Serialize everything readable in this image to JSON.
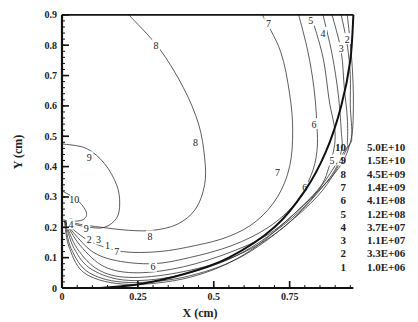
{
  "chart_data": {
    "type": "contour",
    "title": "",
    "xlabel": "X (cm)",
    "ylabel": "Y (cm)",
    "xlim": [
      0,
      0.96
    ],
    "ylim": [
      0,
      0.9
    ],
    "x_ticks": [
      {
        "value": 0,
        "label": "0"
      },
      {
        "value": 0.25,
        "label": "0.25"
      },
      {
        "value": 0.5,
        "label": "0.5"
      },
      {
        "value": 0.75,
        "label": "0.75"
      }
    ],
    "y_ticks": [
      {
        "value": 0,
        "label": "0"
      },
      {
        "value": 0.1,
        "label": "0.1"
      },
      {
        "value": 0.2,
        "label": "0.2"
      },
      {
        "value": 0.3,
        "label": "0.3"
      },
      {
        "value": 0.4,
        "label": "0.4"
      },
      {
        "value": 0.5,
        "label": "0.5"
      },
      {
        "value": 0.6,
        "label": "0.6"
      },
      {
        "value": 0.7,
        "label": "0.7"
      },
      {
        "value": 0.8,
        "label": "0.8"
      },
      {
        "value": 0.9,
        "label": "0.9"
      }
    ],
    "grid": false,
    "legend_position": "right",
    "legend": [
      {
        "level": "10",
        "value": "5.0E+10"
      },
      {
        "level": "9",
        "value": "1.5E+10"
      },
      {
        "level": "8",
        "value": "4.5E+09"
      },
      {
        "level": "7",
        "value": "1.4E+09"
      },
      {
        "level": "6",
        "value": "4.1E+08"
      },
      {
        "level": "5",
        "value": "1.2E+08"
      },
      {
        "level": "4",
        "value": "3.7E+07"
      },
      {
        "level": "3",
        "value": "1.1E+07"
      },
      {
        "level": "2",
        "value": "3.3E+06"
      },
      {
        "level": "1",
        "value": "1.0E+06"
      }
    ],
    "boundary": {
      "description": "quarter-circle domain edge from (0.96,0.9) curving down to (0.1,0)",
      "points": [
        [
          0.96,
          0.9
        ],
        [
          0.95,
          0.75
        ],
        [
          0.92,
          0.6
        ],
        [
          0.87,
          0.45
        ],
        [
          0.8,
          0.32
        ],
        [
          0.7,
          0.2
        ],
        [
          0.55,
          0.1
        ],
        [
          0.4,
          0.045
        ],
        [
          0.25,
          0.012
        ],
        [
          0.12,
          0.0
        ]
      ]
    },
    "contours": [
      {
        "level": "8",
        "points": [
          [
            0.22,
            0.9
          ],
          [
            0.32,
            0.79
          ],
          [
            0.4,
            0.66
          ],
          [
            0.45,
            0.54
          ],
          [
            0.47,
            0.43
          ],
          [
            0.47,
            0.34
          ],
          [
            0.44,
            0.26
          ],
          [
            0.38,
            0.21
          ],
          [
            0.3,
            0.19
          ],
          [
            0.22,
            0.19
          ],
          [
            0.13,
            0.2
          ],
          [
            0.06,
            0.21
          ],
          [
            0.02,
            0.22
          ]
        ],
        "labels": [
          {
            "x": 0.31,
            "y": 0.8
          },
          [
            0.44,
            0.48
          ],
          [
            0.29,
            0.17
          ]
        ]
      },
      {
        "level": "9",
        "points": [
          [
            0.0,
            0.475
          ],
          [
            0.08,
            0.46
          ],
          [
            0.14,
            0.41
          ],
          [
            0.18,
            0.34
          ],
          [
            0.19,
            0.28
          ],
          [
            0.18,
            0.23
          ],
          [
            0.14,
            0.2
          ],
          [
            0.09,
            0.2
          ],
          [
            0.04,
            0.21
          ],
          [
            0.01,
            0.22
          ]
        ],
        "labels": [
          [
            0.09,
            0.43
          ],
          [
            0.08,
            0.195
          ]
        ]
      },
      {
        "level": "10",
        "points": [
          [
            0.0,
            0.32
          ],
          [
            0.05,
            0.29
          ],
          [
            0.08,
            0.25
          ],
          [
            0.07,
            0.225
          ],
          [
            0.03,
            0.22
          ],
          [
            0.005,
            0.225
          ]
        ],
        "labels": [
          [
            0.04,
            0.29
          ]
        ]
      },
      {
        "level": "7",
        "points": [
          [
            0.66,
            0.9
          ],
          [
            0.72,
            0.78
          ],
          [
            0.75,
            0.64
          ],
          [
            0.76,
            0.52
          ],
          [
            0.75,
            0.4
          ],
          [
            0.71,
            0.3
          ],
          [
            0.64,
            0.22
          ],
          [
            0.55,
            0.17
          ],
          [
            0.44,
            0.14
          ],
          [
            0.32,
            0.12
          ],
          [
            0.2,
            0.12
          ],
          [
            0.1,
            0.15
          ],
          [
            0.04,
            0.19
          ],
          [
            0.01,
            0.22
          ]
        ],
        "labels": [
          [
            0.68,
            0.87
          ],
          [
            0.71,
            0.38
          ],
          [
            0.18,
            0.12
          ]
        ]
      },
      {
        "level": "6",
        "points": [
          [
            0.78,
            0.9
          ],
          [
            0.81,
            0.78
          ],
          [
            0.83,
            0.66
          ],
          [
            0.84,
            0.54
          ],
          [
            0.84,
            0.45
          ],
          [
            0.82,
            0.37
          ],
          [
            0.77,
            0.28
          ],
          [
            0.68,
            0.2
          ],
          [
            0.56,
            0.14
          ],
          [
            0.42,
            0.1
          ],
          [
            0.3,
            0.08
          ],
          [
            0.18,
            0.09
          ],
          [
            0.1,
            0.12
          ],
          [
            0.04,
            0.18
          ],
          [
            0.01,
            0.22
          ]
        ],
        "labels": [
          [
            0.83,
            0.54
          ],
          [
            0.8,
            0.33
          ],
          [
            0.3,
            0.07
          ]
        ]
      },
      {
        "level": "5",
        "points": [
          [
            0.82,
            0.9
          ],
          [
            0.86,
            0.76
          ],
          [
            0.88,
            0.62
          ],
          [
            0.9,
            0.5
          ],
          [
            0.88,
            0.4
          ],
          [
            0.84,
            0.32
          ],
          [
            0.7,
            0.19
          ],
          [
            0.56,
            0.12
          ],
          [
            0.4,
            0.07
          ],
          [
            0.25,
            0.05
          ],
          [
            0.14,
            0.07
          ],
          [
            0.06,
            0.14
          ],
          [
            0.01,
            0.22
          ]
        ],
        "labels": [
          [
            0.82,
            0.88
          ],
          [
            0.89,
            0.42
          ],
          [
            0.03,
            0.22
          ]
        ]
      },
      {
        "level": "4",
        "points": [
          [
            0.86,
            0.9
          ],
          [
            0.89,
            0.77
          ],
          [
            0.91,
            0.64
          ],
          [
            0.92,
            0.52
          ],
          [
            0.92,
            0.45
          ],
          [
            0.88,
            0.36
          ],
          [
            0.73,
            0.2
          ],
          [
            0.56,
            0.1
          ],
          [
            0.38,
            0.05
          ],
          [
            0.22,
            0.035
          ],
          [
            0.12,
            0.06
          ],
          [
            0.05,
            0.13
          ],
          [
            0.01,
            0.22
          ]
        ],
        "labels": [
          [
            0.86,
            0.84
          ],
          [
            0.92,
            0.42
          ],
          [
            0.03,
            0.21
          ]
        ]
      },
      {
        "level": "3",
        "points": [
          [
            0.89,
            0.9
          ],
          [
            0.92,
            0.78
          ],
          [
            0.93,
            0.66
          ],
          [
            0.94,
            0.56
          ],
          [
            0.94,
            0.48
          ],
          [
            0.93,
            0.45
          ],
          [
            0.8,
            0.27
          ],
          [
            0.6,
            0.12
          ],
          [
            0.4,
            0.045
          ],
          [
            0.22,
            0.025
          ],
          [
            0.1,
            0.06
          ],
          [
            0.04,
            0.13
          ],
          [
            0.01,
            0.22
          ]
        ],
        "labels": [
          [
            0.92,
            0.79
          ],
          [
            0.12,
            0.16
          ]
        ]
      },
      {
        "level": "2",
        "points": [
          [
            0.92,
            0.9
          ],
          [
            0.94,
            0.8
          ],
          [
            0.95,
            0.7
          ],
          [
            0.95,
            0.6
          ],
          [
            0.955,
            0.5
          ],
          [
            0.94,
            0.46
          ],
          [
            0.84,
            0.3
          ],
          [
            0.62,
            0.12
          ],
          [
            0.42,
            0.04
          ],
          [
            0.22,
            0.018
          ],
          [
            0.09,
            0.05
          ],
          [
            0.03,
            0.13
          ],
          [
            0.01,
            0.22
          ]
        ],
        "labels": [
          [
            0.94,
            0.82
          ],
          [
            0.09,
            0.16
          ]
        ]
      },
      {
        "level": "1",
        "points": [
          [
            0.94,
            0.9
          ],
          [
            0.955,
            0.75
          ],
          [
            0.96,
            0.6
          ],
          [
            0.95,
            0.48
          ],
          [
            0.9,
            0.38
          ],
          [
            0.76,
            0.24
          ],
          [
            0.6,
            0.11
          ],
          [
            0.42,
            0.035
          ],
          [
            0.22,
            0.012
          ],
          [
            0.08,
            0.045
          ],
          [
            0.025,
            0.13
          ],
          [
            0.008,
            0.22
          ]
        ],
        "labels": [
          [
            0.15,
            0.14
          ]
        ]
      }
    ]
  }
}
